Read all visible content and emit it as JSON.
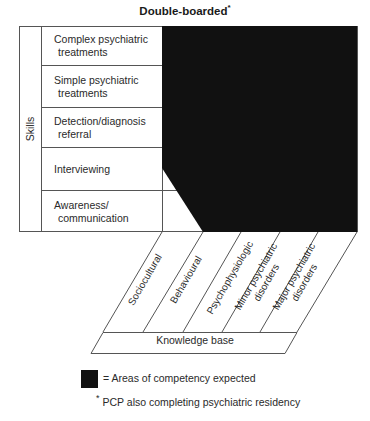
{
  "title": "Double-boarded",
  "title_marker": "*",
  "axes": {
    "skills_label": "Skills",
    "knowledge_label": "Knowledge base"
  },
  "skills": [
    {
      "line1": "Complex psychiatric",
      "line2": "treatments"
    },
    {
      "line1": "Simple psychiatric",
      "line2": "treatments"
    },
    {
      "line1": "Detection/diagnosis",
      "line2": "referral"
    },
    {
      "line1": "Interviewing",
      "line2": ""
    },
    {
      "line1": "Awareness/",
      "line2": "communication"
    }
  ],
  "knowledge": [
    {
      "line1": "Sociocultural",
      "line2": ""
    },
    {
      "line1": "Behavioural",
      "line2": ""
    },
    {
      "line1": "Psychophysiologic",
      "line2": ""
    },
    {
      "line1": "Minor psychiatric",
      "line2": "disorders"
    },
    {
      "line1": "Major psychiatric",
      "line2": "disorders"
    }
  ],
  "legend": {
    "swatch_color": "#111111",
    "text": "= Areas of competency expected"
  },
  "footnote": {
    "marker": "*",
    "text": "PCP also completing psychiatric residency"
  },
  "colors": {
    "fill": "#111111",
    "line": "#555555"
  }
}
